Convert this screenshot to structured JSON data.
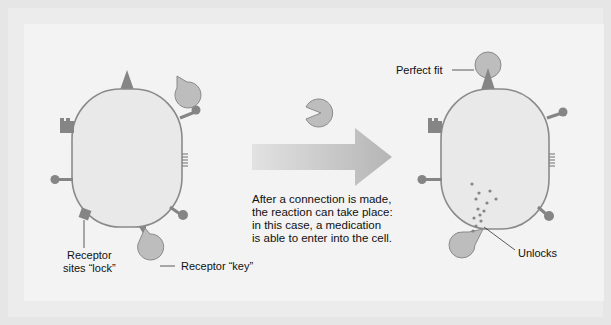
{
  "labels": {
    "receptor_sites_lock_line1": "Receptor",
    "receptor_sites_lock_line2": "sites “lock”",
    "receptor_key": "Receptor “key”",
    "perfect_fit": "Perfect fit",
    "unlocks": "Unlocks"
  },
  "caption": {
    "lines": [
      "After a connection is made,",
      "the reaction can take place:",
      "in this case, a medication",
      "is able to enter into the cell."
    ]
  },
  "colors": {
    "background": "#e6e6e6",
    "panel": "#f3f3f3",
    "cell_fill": "#e9e9e9",
    "cell_stroke": "#8a8a8a",
    "receptor_dark": "#858585",
    "key_fill": "#bdbdbd",
    "arrow_start": "#e0e0e0",
    "arrow_end": "#b8b8b8"
  }
}
